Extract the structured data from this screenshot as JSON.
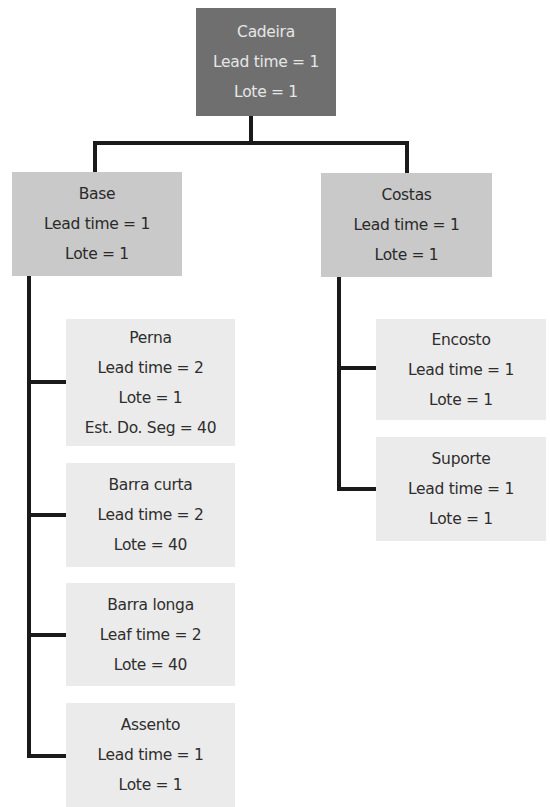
{
  "diagram": {
    "type": "tree",
    "colors": {
      "root_fill": "#6f6f6f",
      "root_text": "#e6e6e6",
      "level1_fill": "#c9c9c9",
      "level2_fill": "#ebebeb",
      "text": "#2a2a2a",
      "connector": "#1a1a1a"
    },
    "root": {
      "name": "Cadeira",
      "lead_time": "Lead time = 1",
      "lote": "Lote = 1"
    },
    "base": {
      "name": "Base",
      "lead_time": "Lead time = 1",
      "lote": "Lote = 1",
      "children": [
        {
          "name": "Perna",
          "lead_time": "Lead time = 2",
          "lote": "Lote = 1",
          "extra": "Est. Do. Seg = 40"
        },
        {
          "name": "Barra curta",
          "lead_time": "Lead time = 2",
          "lote": "Lote = 40"
        },
        {
          "name": "Barra longa",
          "lead_time": "Leaf time = 2",
          "lote": "Lote = 40"
        },
        {
          "name": "Assento",
          "lead_time": "Lead time = 1",
          "lote": "Lote = 1"
        }
      ]
    },
    "costas": {
      "name": "Costas",
      "lead_time": "Lead time = 1",
      "lote": "Lote = 1",
      "children": [
        {
          "name": "Encosto",
          "lead_time": "Lead time = 1",
          "lote": "Lote = 1"
        },
        {
          "name": "Suporte",
          "lead_time": "Lead time = 1",
          "lote": "Lote = 1"
        }
      ]
    }
  }
}
